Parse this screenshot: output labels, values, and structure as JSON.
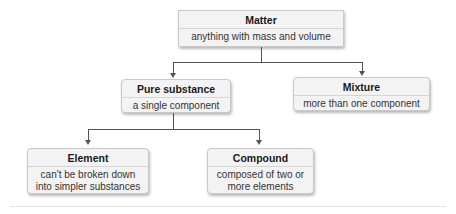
{
  "diagram": {
    "type": "hierarchy",
    "nodes": {
      "matter": {
        "title": "Matter",
        "description": "anything with mass and volume"
      },
      "pure_substance": {
        "title": "Pure substance",
        "description": "a single component"
      },
      "mixture": {
        "title": "Mixture",
        "description": "more than one component"
      },
      "element": {
        "title": "Element",
        "description_line1": "can't be broken down",
        "description_line2": "into simpler substances"
      },
      "compound": {
        "title": "Compound",
        "description_line1": "composed of two or",
        "description_line2": "more elements"
      }
    },
    "edges": [
      {
        "from": "Matter",
        "to": "Pure substance"
      },
      {
        "from": "Matter",
        "to": "Mixture"
      },
      {
        "from": "Pure substance",
        "to": "Element"
      },
      {
        "from": "Pure substance",
        "to": "Compound"
      }
    ],
    "colors": {
      "box_fill": "#f3f3f3",
      "box_border": "#c9c9c9",
      "connector": "#555555"
    }
  }
}
